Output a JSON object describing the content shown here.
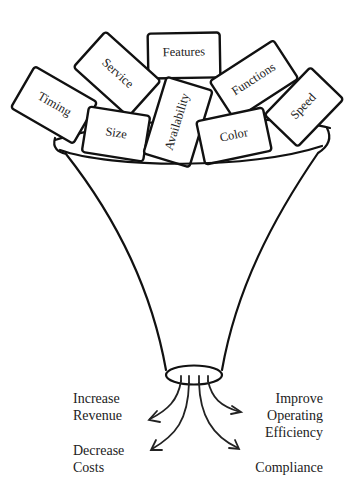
{
  "diagram": {
    "type": "funnel",
    "inputs": [
      {
        "label": "Timing"
      },
      {
        "label": "Service"
      },
      {
        "label": "Features"
      },
      {
        "label": "Size"
      },
      {
        "label": "Availability"
      },
      {
        "label": "Functions"
      },
      {
        "label": "Color"
      },
      {
        "label": "Speed"
      }
    ],
    "outputs": {
      "increase_revenue": [
        "Increase",
        "Revenue"
      ],
      "decrease_costs": [
        "Decrease",
        "Costs"
      ],
      "improve_efficiency": [
        "Improve",
        "Operating",
        "Efficiency"
      ],
      "compliance": [
        "Compliance"
      ]
    },
    "colors": {
      "stroke": "#111111",
      "background": "#ffffff",
      "text": "#222222"
    }
  }
}
